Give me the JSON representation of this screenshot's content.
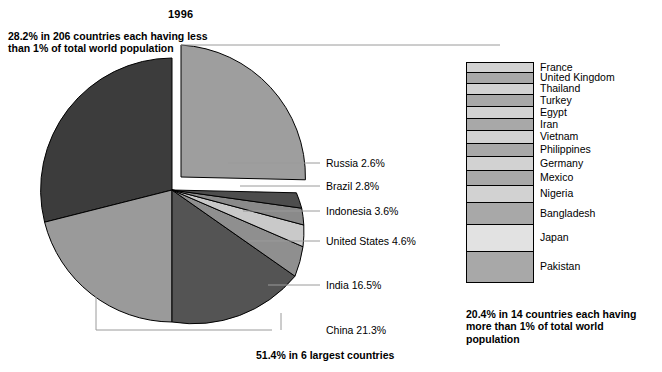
{
  "title": "1996",
  "annotations": {
    "small_countries": "28.2% in 206 countries each having less than 1% of total world population",
    "big_countries": "20.4% in 14 countries each having more than 1% of total world population",
    "six_largest": "51.4% in 6 largest countries"
  },
  "chart_data": {
    "type": "pie",
    "title": "1996",
    "unit": "percent of total world population",
    "slices": [
      {
        "label": "China",
        "value": 21.3,
        "display": "China 21.3%",
        "color": "#9a9a9a"
      },
      {
        "label": "India",
        "value": 16.5,
        "display": "India 16.5%",
        "color": "#545454"
      },
      {
        "label": "United States",
        "value": 4.6,
        "display": "United States 4.6%",
        "color": "#8f8f8f"
      },
      {
        "label": "Indonesia",
        "value": 3.6,
        "display": "Indonesia 3.6%",
        "color": "#c9c9c9"
      },
      {
        "label": "Brazil",
        "value": 2.8,
        "display": "Brazil 2.8%",
        "color": "#8a8a8a"
      },
      {
        "label": "Russia",
        "value": 2.6,
        "display": "Russia 2.6%",
        "color": "#4d4d4d"
      },
      {
        "label": "14 countries each more than 1%",
        "value": 20.4,
        "display": "20.4%",
        "color": "#9e9e9e"
      },
      {
        "label": "206 countries each less than 1%",
        "value": 28.2,
        "display": "28.2%",
        "color": "#3c3c3c"
      }
    ],
    "exploded_slice": "14 countries each more than 1%",
    "breakdown_bar": {
      "total": 20.4,
      "label": "20.4% in 14 countries each having more than 1% of total world population",
      "items": [
        {
          "name": "France",
          "color": "#d2d2d2"
        },
        {
          "name": "United Kingdom",
          "color": "#a8a8a8"
        },
        {
          "name": "Thailand",
          "color": "#d2d2d2"
        },
        {
          "name": "Turkey",
          "color": "#a8a8a8"
        },
        {
          "name": "Egypt",
          "color": "#d2d2d2"
        },
        {
          "name": "Iran",
          "color": "#a8a8a8"
        },
        {
          "name": "Vietnam",
          "color": "#d2d2d2"
        },
        {
          "name": "Philippines",
          "color": "#a8a8a8"
        },
        {
          "name": "Germany",
          "color": "#d2d2d2"
        },
        {
          "name": "Mexico",
          "color": "#a8a8a8"
        },
        {
          "name": "Nigeria",
          "color": "#d2d2d2"
        },
        {
          "name": "Bangladesh",
          "color": "#a8a8a8"
        },
        {
          "name": "Japan",
          "color": "#e2e2e2"
        },
        {
          "name": "Pakistan",
          "color": "#a8a8a8"
        }
      ]
    }
  },
  "slice_labels": [
    {
      "text": "Russia 2.6%"
    },
    {
      "text": "Brazil 2.8%"
    },
    {
      "text": "Indonesia 3.6%"
    },
    {
      "text": "United States 4.6%"
    },
    {
      "text": "India 16.5%"
    },
    {
      "text": "China 21.3%"
    }
  ]
}
